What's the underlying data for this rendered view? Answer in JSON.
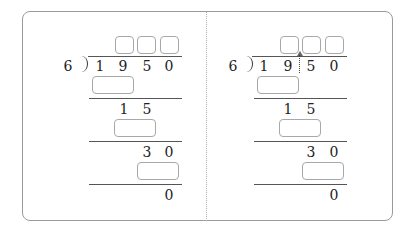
{
  "problem": {
    "divisor": "6",
    "dividend_digits": [
      "1",
      "9",
      "5",
      "0"
    ],
    "quotient_boxes": [
      "",
      "",
      ""
    ],
    "steps": [
      {
        "answer_box": "",
        "remainder_digits": [
          "1",
          "5"
        ]
      },
      {
        "answer_box": "",
        "remainder_digits": [
          "3",
          "0"
        ]
      },
      {
        "answer_box": "",
        "remainder_digits": [
          "0"
        ]
      }
    ]
  },
  "panels": [
    {
      "id": "left",
      "show_split_marker": false
    },
    {
      "id": "right",
      "show_split_marker": true,
      "split_after_digit_index": 1
    }
  ],
  "colors": {
    "card_border": "#9a9a9a",
    "box_border": "#a8a8a8",
    "rule_line": "#555555",
    "text": "#222222"
  }
}
